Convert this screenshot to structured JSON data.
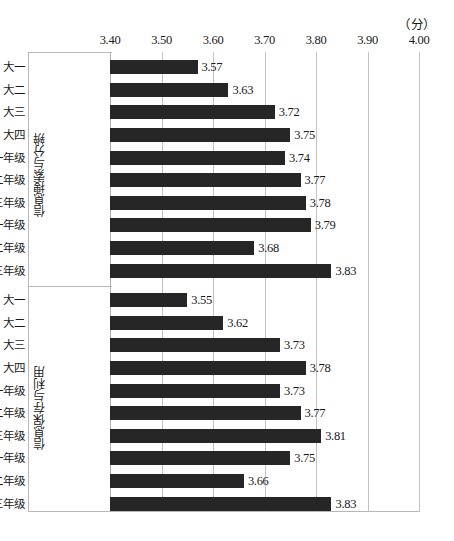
{
  "unit_label": "（分）",
  "axis": {
    "ticks": [
      "3.40",
      "3.50",
      "3.60",
      "3.70",
      "3.80",
      "3.90",
      "4.00"
    ],
    "min": 3.4,
    "max": 4.0
  },
  "groups": [
    {
      "name": "信息搜索与分辨",
      "categories": [
        "大一",
        "大二",
        "大三",
        "大四",
        "硕士一年级",
        "硕士二年级",
        "硕士三年级",
        "博士一年级",
        "博士二年级",
        "博士三年级"
      ],
      "values": [
        3.57,
        3.63,
        3.72,
        3.75,
        3.74,
        3.77,
        3.78,
        3.79,
        3.68,
        3.83
      ],
      "value_labels": [
        "3.57",
        "3.63",
        "3.72",
        "3.75",
        "3.74",
        "3.77",
        "3.78",
        "3.79",
        "3.68",
        "3.83"
      ]
    },
    {
      "name": "信息保存与利用",
      "categories": [
        "大一",
        "大二",
        "大三",
        "大四",
        "硕士一年级",
        "硕士二年级",
        "硕士三年级",
        "博士一年级",
        "博士二年级",
        "博士三年级"
      ],
      "values": [
        3.55,
        3.62,
        3.73,
        3.78,
        3.73,
        3.77,
        3.81,
        3.75,
        3.66,
        3.83
      ],
      "value_labels": [
        "3.55",
        "3.62",
        "3.73",
        "3.78",
        "3.73",
        "3.77",
        "3.81",
        "3.75",
        "3.66",
        "3.83"
      ]
    }
  ],
  "colors": {
    "bar": "#262626",
    "gridline": "#c2c2c2",
    "frame": "#b8b8b8",
    "background": "#ffffff",
    "text": "#1a1a1a"
  },
  "chart_data": {
    "type": "bar",
    "orientation": "horizontal",
    "title": "",
    "subtitle": "",
    "xlabel": "（分）",
    "ylabel": "",
    "xlim": [
      3.4,
      4.0
    ],
    "grid": true,
    "legend": "none",
    "categories": [
      "信息搜索与分辨 - 大一",
      "信息搜索与分辨 - 大二",
      "信息搜索与分辨 - 大三",
      "信息搜索与分辨 - 大四",
      "信息搜索与分辨 - 硕士一年级",
      "信息搜索与分辨 - 硕士二年级",
      "信息搜索与分辨 - 硕士三年级",
      "信息搜索与分辨 - 博士一年级",
      "信息搜索与分辨 - 博士二年级",
      "信息搜索与分辨 - 博士三年级",
      "信息保存与利用 - 大一",
      "信息保存与利用 - 大二",
      "信息保存与利用 - 大三",
      "信息保存与利用 - 大四",
      "信息保存与利用 - 硕士一年级",
      "信息保存与利用 - 硕士二年级",
      "信息保存与利用 - 硕士三年级",
      "信息保存与利用 - 博士一年级",
      "信息保存与利用 - 博士二年级",
      "信息保存与利用 - 博士三年级"
    ],
    "values": [
      3.57,
      3.63,
      3.72,
      3.75,
      3.74,
      3.77,
      3.78,
      3.79,
      3.68,
      3.83,
      3.55,
      3.62,
      3.73,
      3.78,
      3.73,
      3.77,
      3.81,
      3.75,
      3.66,
      3.83
    ],
    "xticks": [
      3.4,
      3.5,
      3.6,
      3.7,
      3.8,
      3.9,
      4.0
    ],
    "xticklabels": [
      "3.40",
      "3.50",
      "3.60",
      "3.70",
      "3.80",
      "3.90",
      "4.00"
    ]
  }
}
